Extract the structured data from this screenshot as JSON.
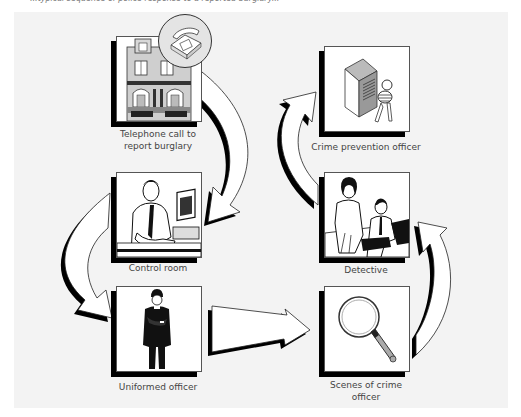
{
  "caption_fragment": "...typical sequence of police response to a reported burglary...",
  "nodes": [
    {
      "id": "telephone",
      "label_line1": "Telephone call to",
      "label_line2": "report burglary",
      "icon": "house-with-telephone-icon"
    },
    {
      "id": "control-room",
      "label_line1": "Control room",
      "label_line2": "",
      "icon": "operator-at-computer-icon"
    },
    {
      "id": "uniformed-officer",
      "label_line1": "Uniformed officer",
      "label_line2": "",
      "icon": "police-constable-icon"
    },
    {
      "id": "scenes-of-crime",
      "label_line1": "Scenes of crime",
      "label_line2": "officer",
      "icon": "magnifying-glass-icon"
    },
    {
      "id": "detective",
      "label_line1": "Detective",
      "label_line2": "",
      "icon": "detective-interview-icon"
    },
    {
      "id": "crime-prevention",
      "label_line1": "Crime prevention officer",
      "label_line2": "",
      "icon": "lock-box-and-keys-icon"
    }
  ],
  "edges": [
    {
      "from": "telephone",
      "to": "control-room"
    },
    {
      "from": "control-room",
      "to": "uniformed-officer"
    },
    {
      "from": "uniformed-officer",
      "to": "scenes-of-crime"
    },
    {
      "from": "scenes-of-crime",
      "to": "detective"
    },
    {
      "from": "detective",
      "to": "crime-prevention"
    }
  ],
  "colors": {
    "panel_bg": "#f3f3f3",
    "box_bg": "#ffffff",
    "shadow": "#000000",
    "text": "#444444"
  }
}
